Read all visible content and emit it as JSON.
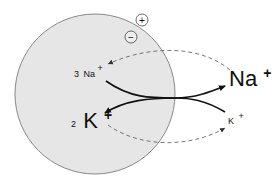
{
  "diagram": {
    "cell": {
      "fill": "#e6e6e6",
      "stroke": "#888888"
    },
    "charges": {
      "outside": "+",
      "inside": "−"
    },
    "inside_labels": {
      "na_count": "3",
      "na_symbol": "Na",
      "na_charge": "+",
      "k_count": "2",
      "k_symbol": "K",
      "k_charge": "+"
    },
    "outside_labels": {
      "na_symbol": "Na",
      "na_charge": "+",
      "k_symbol": "K",
      "k_charge": "+"
    }
  }
}
